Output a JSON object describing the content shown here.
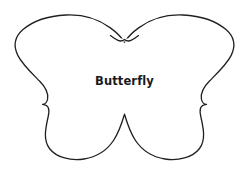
{
  "canvas": {
    "width": 249,
    "height": 171,
    "background_color": "#ffffff"
  },
  "artwork": {
    "kind": "outline-template",
    "subject_label": "Butterfly",
    "stroke_color": "#231f20",
    "fill_color": "#ffffff",
    "stroke_width": 1.3,
    "label_color": "#1a1a1a"
  },
  "label": {
    "text": "Butterfly"
  }
}
